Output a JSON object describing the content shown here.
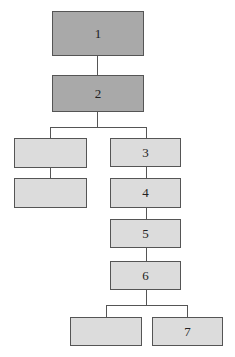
{
  "diagram": {
    "type": "tree",
    "colors": {
      "dark_fill": "#a9a9a9",
      "light_fill": "#dcdcdc",
      "stroke": "#555555"
    },
    "nodes": [
      {
        "id": "n1",
        "label": "1",
        "fill": "dark"
      },
      {
        "id": "n2",
        "label": "2",
        "fill": "dark"
      },
      {
        "id": "left-a",
        "label": "",
        "fill": "light"
      },
      {
        "id": "left-b",
        "label": "",
        "fill": "light"
      },
      {
        "id": "n3",
        "label": "3",
        "fill": "light"
      },
      {
        "id": "n4",
        "label": "4",
        "fill": "light"
      },
      {
        "id": "n5",
        "label": "5",
        "fill": "light"
      },
      {
        "id": "n6",
        "label": "6",
        "fill": "light"
      },
      {
        "id": "bottom-left",
        "label": "",
        "fill": "light"
      },
      {
        "id": "n7",
        "label": "7",
        "fill": "light"
      }
    ],
    "edges": [
      [
        "n1",
        "n2"
      ],
      [
        "n2",
        "left-a"
      ],
      [
        "n2",
        "n3"
      ],
      [
        "left-a",
        "left-b"
      ],
      [
        "n3",
        "n4"
      ],
      [
        "n4",
        "n5"
      ],
      [
        "n5",
        "n6"
      ],
      [
        "n6",
        "bottom-left"
      ],
      [
        "n6",
        "n7"
      ]
    ]
  }
}
